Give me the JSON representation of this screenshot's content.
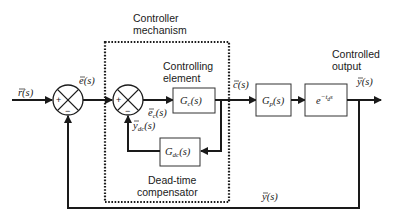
{
  "labels": {
    "controller_mechanism": [
      "Controller",
      "mechanism"
    ],
    "controlling_element": [
      "Controlling",
      "element"
    ],
    "dead_time_compensator": [
      "Dead-time",
      "compensator"
    ],
    "controlled_output": [
      "Controlled",
      "output"
    ]
  },
  "signals": {
    "reference": "r(s)",
    "error": "e(s)",
    "controller_error": "e",
    "controller_error_sub": "c",
    "controller_error_tail": "(s)",
    "compensator_output": "y",
    "compensator_output_sub": "dc",
    "compensator_output_tail": "(s)",
    "control": "c(s)",
    "output": "y(s)",
    "feedback": "y(s)"
  },
  "blocks": {
    "controller": {
      "base": "G",
      "sub": "c",
      "tail": "(s)"
    },
    "compensator": {
      "base": "G",
      "sub": "dc",
      "tail": "(s)"
    },
    "process": {
      "base": "G",
      "sub": "p",
      "tail": "(s)"
    },
    "delay": {
      "base": "e",
      "exp_prefix": "−t",
      "exp_sub": "d",
      "exp_tail": "s"
    }
  },
  "summing_junctions": [
    {
      "name": "main",
      "signs": {
        "left": "+",
        "bottom": "−"
      }
    },
    {
      "name": "controller",
      "signs": {
        "left": "+",
        "bottom": "−"
      }
    }
  ]
}
